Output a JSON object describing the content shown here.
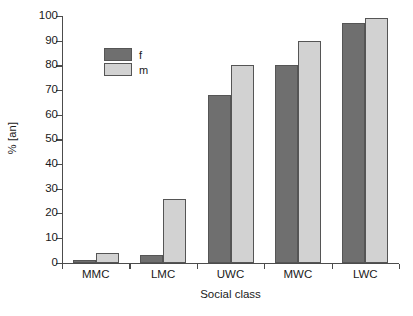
{
  "chart_data": {
    "type": "bar",
    "title": "",
    "xlabel": "Social class",
    "ylabel": "% [an]",
    "categories": [
      "MMC",
      "LMC",
      "UWC",
      "MWC",
      "LWC"
    ],
    "series": [
      {
        "name": "f",
        "color": "#6f6f6f",
        "values": [
          1,
          3,
          68,
          80,
          97
        ]
      },
      {
        "name": "m",
        "color": "#d2d2d2",
        "values": [
          4,
          26,
          80,
          90,
          99
        ]
      }
    ],
    "ylim": [
      0,
      100
    ],
    "yticks": [
      0,
      10,
      20,
      30,
      40,
      50,
      60,
      70,
      80,
      90,
      100
    ],
    "ytick_labels": [
      "0",
      "10",
      "20",
      "30",
      "40",
      "50",
      "60",
      "70",
      "80",
      "90",
      "100"
    ],
    "grid": false,
    "legend_position": "upper-left-inside",
    "legend_entries": [
      "f",
      "m"
    ]
  }
}
